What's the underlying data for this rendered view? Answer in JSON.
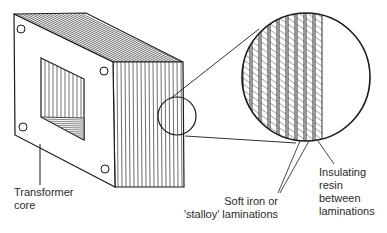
{
  "diagram": {
    "type": "technical-illustration",
    "colors": {
      "line": "#1a1a1a",
      "background": "#ffffff",
      "label_text": "#2a2a2a"
    },
    "labels": {
      "transformer_core": [
        "Transformer",
        "core"
      ],
      "soft_iron": [
        "Soft iron or",
        "'stalloy' laminations"
      ],
      "insulating_resin": [
        "Insulating",
        "resin",
        "between",
        "laminations"
      ]
    },
    "magnifier": {
      "small_circle": {
        "cx": 177,
        "cy": 116,
        "r": 19
      },
      "large_circle": {
        "cx": 306,
        "cy": 77,
        "r": 64
      }
    }
  }
}
